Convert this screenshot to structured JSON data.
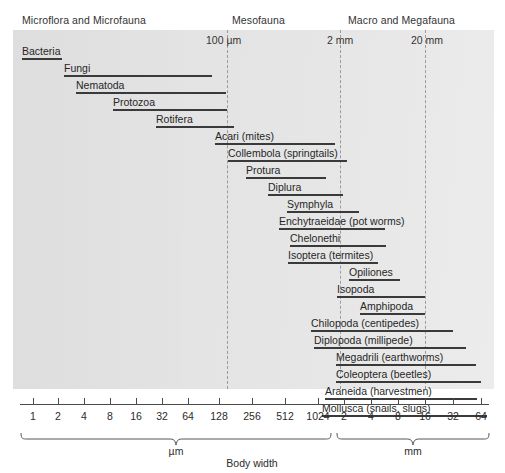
{
  "chart_data": {
    "type": "bar",
    "title": "",
    "xlabel": "Body width",
    "ylabel": "",
    "orientation": "horizontal",
    "scale": "log2",
    "grid": false,
    "legend": null,
    "axis": {
      "tick_labels_um": [
        "1",
        "2",
        "4",
        "8",
        "16",
        "32",
        "64",
        "128",
        "256",
        "512",
        "1024"
      ],
      "tick_labels_mm": [
        "2",
        "4",
        "8",
        "16",
        "32",
        "64"
      ],
      "unit_left": "µm",
      "unit_right": "mm",
      "xlim_um": [
        1,
        1024
      ],
      "xlim_mm": [
        2,
        64
      ]
    },
    "groups": [
      {
        "name": "Microflora and Microfauna"
      },
      {
        "name": "Mesofauna"
      },
      {
        "name": "Macro and Megafauna"
      }
    ],
    "boundaries": [
      {
        "label": "100 µm",
        "value_um": 100
      },
      {
        "label": "2 mm",
        "value_mm": 2
      },
      {
        "label": "20 mm",
        "value_mm": 20
      }
    ],
    "categories": [
      "Bacteria",
      "Fungi",
      "Nematoda",
      "Protozoa",
      "Rotifera",
      "Acari (mites)",
      "Collembola (springtails)",
      "Protura",
      "Diplura",
      "Symphyla",
      "Enchytraeidae (pot worms)",
      "Chelonethi",
      "Isoptera (termites)",
      "Opiliones",
      "Isopoda",
      "Amphipoda",
      "Chilopoda (centipedes)",
      "Diplopoda (millipede)",
      "Megadrili (earthworms)",
      "Coleoptera (beetles)",
      "Araneida (harvestmen)",
      "Mollusca (snails, slugs)"
    ],
    "ranges_um": [
      {
        "name": "Bacteria",
        "min": 1.0,
        "max": 3.0
      },
      {
        "name": "Fungi",
        "min": 5.5,
        "max": 64.0
      },
      {
        "name": "Nematoda",
        "min": 8.0,
        "max": 100.0
      },
      {
        "name": "Protozoa",
        "min": 19.0,
        "max": 103.0
      },
      {
        "name": "Rotifera",
        "min": 57.0,
        "max": 128.0
      },
      {
        "name": "Acari (mites)",
        "min": 115.0,
        "max": 800.0
      },
      {
        "name": "Collembola (springtails)",
        "min": 160.0,
        "max": 1100.0
      },
      {
        "name": "Protura",
        "min": 175.0,
        "max": 470.0
      },
      {
        "name": "Diplura",
        "min": 290.0,
        "max": 1100.0
      },
      {
        "name": "Symphyla",
        "min": 490.0,
        "max": 1500.0
      },
      {
        "name": "Enchytraeidae (pot worms)",
        "min": 400.0,
        "max": 2400.0
      },
      {
        "name": "Chelonethi",
        "min": 490.0,
        "max": 2400.0
      },
      {
        "name": "Isoptera (termites)",
        "min": 440.0,
        "max": 2000.0
      }
    ],
    "ranges_mm": [
      {
        "name": "Opiliones",
        "min": 2.4,
        "max": 7.0
      },
      {
        "name": "Isopoda",
        "min": 1.8,
        "max": 20.0
      },
      {
        "name": "Amphipoda",
        "min": 3.2,
        "max": 20.0
      },
      {
        "name": "Chilopoda (centipedes)",
        "min": 1.9,
        "max": 28.0
      },
      {
        "name": "Diplopoda (millipede)",
        "min": 1.9,
        "max": 34.0
      },
      {
        "name": "Megadrili (earthworms)",
        "min": 2.6,
        "max": 40.0
      },
      {
        "name": "Coleoptera (beetles)",
        "min": 2.4,
        "max": 42.0
      },
      {
        "name": "Araneida (harvestmen)",
        "min": 2.1,
        "max": 40.0
      },
      {
        "name": "Mollusca (snails, slugs)",
        "min": 2.0,
        "max": 56.0
      }
    ]
  },
  "header": {
    "group1": "Microflora and Microfauna",
    "group2": "Mesofauna",
    "group3": "Macro and Megafauna"
  },
  "boundaries": {
    "b100um": "100 µm",
    "b2mm": "2 mm",
    "b20mm": "20 mm"
  },
  "rows": [
    {
      "label": "Bacteria",
      "top": 40,
      "lx": 22,
      "bx": 22,
      "bw": 40
    },
    {
      "label": "Fungi",
      "top": 57,
      "lx": 64,
      "bx": 64,
      "bw": 148
    },
    {
      "label": "Nematoda",
      "top": 74,
      "lx": 76,
      "bx": 76,
      "bw": 150
    },
    {
      "label": "Protozoa",
      "top": 91,
      "lx": 113,
      "bx": 113,
      "bw": 114
    },
    {
      "label": "Rotifera",
      "top": 108,
      "lx": 156,
      "bx": 156,
      "bw": 78
    },
    {
      "label": "Acari (mites)",
      "top": 125,
      "lx": 215,
      "bx": 215,
      "bw": 120
    },
    {
      "label": "Collembola (springtails)",
      "top": 142,
      "lx": 228,
      "bx": 228,
      "bw": 119
    },
    {
      "label": "Protura",
      "top": 159,
      "lx": 246,
      "bx": 246,
      "bw": 80
    },
    {
      "label": "Diplura",
      "top": 176,
      "lx": 268,
      "bx": 268,
      "bw": 75
    },
    {
      "label": "Symphyla",
      "top": 193,
      "lx": 287,
      "bx": 287,
      "bw": 72
    },
    {
      "label": "Enchytraeidae (pot worms)",
      "top": 210,
      "lx": 279,
      "bx": 279,
      "bw": 106
    },
    {
      "label": "Chelonethi",
      "top": 227,
      "lx": 290,
      "bx": 290,
      "bw": 96
    },
    {
      "label": "Isoptera (termites)",
      "top": 244,
      "lx": 288,
      "bx": 288,
      "bw": 90
    },
    {
      "label": "Opiliones",
      "top": 261,
      "lx": 349,
      "bx": 349,
      "bw": 51
    },
    {
      "label": "Isopoda",
      "top": 278,
      "lx": 337,
      "bx": 337,
      "bw": 88
    },
    {
      "label": "Amphipoda",
      "top": 295,
      "lx": 360,
      "bx": 360,
      "bw": 65
    },
    {
      "label": "Chilopoda (centipedes)",
      "top": 312,
      "lx": 311,
      "bx": 311,
      "bw": 142
    },
    {
      "label": "Diplopoda (millipede)",
      "top": 329,
      "lx": 314,
      "bx": 314,
      "bw": 152
    },
    {
      "label": "Megadrili (earthworms)",
      "top": 346,
      "lx": 336,
      "bx": 336,
      "bw": 140
    },
    {
      "label": "Coleoptera (beetles)",
      "top": 363,
      "lx": 336,
      "bx": 336,
      "bw": 145
    },
    {
      "label": "Araneida (harvestmen)",
      "top": 380,
      "lx": 325,
      "bx": 325,
      "bw": 152
    },
    {
      "label": "Mollusca (snails, slugs)",
      "top": 397,
      "lx": 322,
      "bx": 322,
      "bw": 165
    }
  ],
  "ticks": [
    {
      "label": "1",
      "x": 33
    },
    {
      "label": "2",
      "x": 58
    },
    {
      "label": "4",
      "x": 84
    },
    {
      "label": "8",
      "x": 110
    },
    {
      "label": "16",
      "x": 136
    },
    {
      "label": "32",
      "x": 162
    },
    {
      "label": "64",
      "x": 188
    },
    {
      "label": "128",
      "x": 219
    },
    {
      "label": "256",
      "x": 252
    },
    {
      "label": "512",
      "x": 285
    },
    {
      "label": "1024",
      "x": 318
    },
    {
      "label": "2",
      "x": 344
    },
    {
      "label": "4",
      "x": 371
    },
    {
      "label": "8",
      "x": 398
    },
    {
      "label": "16",
      "x": 425
    },
    {
      "label": "32",
      "x": 453
    },
    {
      "label": "64",
      "x": 481
    }
  ],
  "braces": {
    "um": "µm",
    "mm": "mm"
  },
  "xtitle": "Body width"
}
